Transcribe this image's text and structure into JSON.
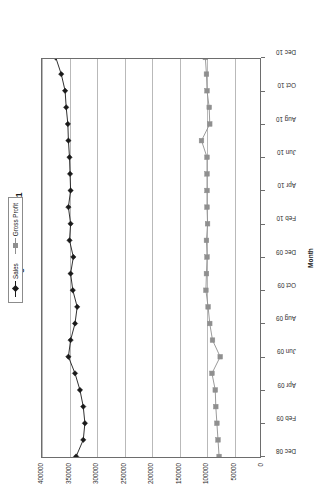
{
  "chart_data": {
    "type": "line",
    "title": "Trailing P &L Data - Part 1",
    "xlabel": "Month",
    "ylabel": "",
    "grid": true,
    "legend_position": "top",
    "ylim": [
      0,
      400000
    ],
    "yticks": [
      0,
      50000,
      100000,
      150000,
      200000,
      250000,
      300000,
      350000,
      400000
    ],
    "ytick_labels": [
      "0",
      "50000",
      "100000",
      "150000",
      "200000",
      "250000",
      "300000",
      "350000",
      "400000"
    ],
    "categories": [
      "Dec 08",
      "Jan 09",
      "Feb 09",
      "Mar 09",
      "Apr 09",
      "May 09",
      "Jun 09",
      "Jul 09",
      "Aug 09",
      "Sep 09",
      "Oct 09",
      "Nov 09",
      "Dec 09",
      "Jan 10",
      "Feb 10",
      "Mar 10",
      "Apr 10",
      "May 10",
      "Jun 10",
      "Jul 10",
      "Aug 10",
      "Sep 10",
      "Oct 10",
      "Nov 10",
      "Dec 10"
    ],
    "xtick_labels": [
      "Dec 08",
      "Feb 09",
      "Apr 09",
      "Jun 09",
      "Aug 09",
      "Oct 09",
      "Dec 09",
      "Feb 10",
      "Apr 10",
      "Jun 10",
      "Aug 10",
      "Oct 10",
      "Dec 10"
    ],
    "xtick_indices": [
      0,
      2,
      4,
      6,
      8,
      10,
      12,
      14,
      16,
      18,
      20,
      22,
      24
    ],
    "series": [
      {
        "name": "Sales",
        "color": "#1a1a1a",
        "marker": "diamond",
        "values": [
          338000,
          325000,
          322000,
          325000,
          331000,
          340000,
          352000,
          348000,
          340000,
          336000,
          344000,
          348000,
          343000,
          350000,
          348000,
          352000,
          348000,
          349000,
          350000,
          352000,
          353000,
          356000,
          358000,
          365000,
          375000
        ]
      },
      {
        "name": "Gross Profit",
        "color": "#8f8f8f",
        "marker": "square",
        "values": [
          78000,
          80000,
          82000,
          84000,
          85000,
          91000,
          76000,
          90000,
          95000,
          98000,
          102000,
          101000,
          100000,
          101000,
          99000,
          100000,
          100000,
          100000,
          100000,
          110000,
          95000,
          96000,
          100000,
          101000,
          103000
        ]
      }
    ]
  },
  "legend": {
    "entries": [
      {
        "label": "Sales"
      },
      {
        "label": "Gross Profit"
      }
    ]
  },
  "colors": {
    "sales": "#1a1a1a",
    "gross_profit": "#8f8f8f",
    "gridline": "#b9b9b9",
    "axis": "#6d6d6d",
    "background": "#ffffff"
  }
}
